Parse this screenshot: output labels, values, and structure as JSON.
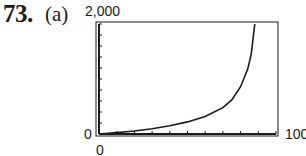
{
  "problem": {
    "number": "73.",
    "part": "(a)"
  },
  "window": {
    "xmin_label": "0",
    "xmax_label": "100",
    "ymin_label": "0",
    "ymax_label": "2,000"
  },
  "chart_data": {
    "type": "line",
    "title": "",
    "xlabel": "",
    "ylabel": "",
    "xlim": [
      0,
      100
    ],
    "ylim": [
      0,
      2000
    ],
    "grid": false,
    "legend": null,
    "x_ticks": 10,
    "y_ticks": 10,
    "series": [
      {
        "name": "curve",
        "x": [
          0,
          10,
          20,
          30,
          40,
          50,
          60,
          70,
          75,
          80,
          84,
          86,
          88
        ],
        "y": [
          0,
          25,
          55,
          95,
          150,
          220,
          320,
          480,
          620,
          860,
          1180,
          1450,
          2000
        ]
      }
    ],
    "annotations": [
      "0",
      "100",
      "0",
      "2,000"
    ]
  },
  "colors": {
    "ink": "#1a1a1a",
    "background": "#ffffff"
  }
}
